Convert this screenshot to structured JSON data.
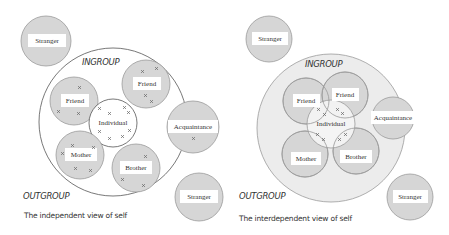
{
  "colors": {
    "circle_fill": "#d6d6d6",
    "circle_stroke": "#9a9a9a",
    "ingroup_fill_interdependent": "#ececec",
    "ingroup_stroke": "#555555",
    "label_box": "#ffffff",
    "text": "#333333"
  },
  "left": {
    "ingroup_label": "INGROUP",
    "outgroup_label": "OUTGROUP",
    "caption": "The independent view of self",
    "nodes": {
      "stranger_top": "Stranger",
      "friend_left": "Friend",
      "friend_right": "Friend",
      "individual": "Individual",
      "acquaintance": "Acquaintance",
      "mother": "Mother",
      "brother": "Brother",
      "stranger_bottom": "Stranger"
    }
  },
  "right": {
    "ingroup_label": "INGROUP",
    "outgroup_label": "OUTGROUP",
    "caption": "The interdependent view of self",
    "nodes": {
      "stranger_top": "Stranger",
      "friend_left": "Friend",
      "friend_right": "Friend",
      "individual": "Individual",
      "acquaintance": "Acquaintance",
      "mother": "Mother",
      "brother": "Brother",
      "stranger_bottom": "Stranger"
    }
  }
}
